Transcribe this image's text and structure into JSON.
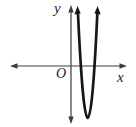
{
  "figure": {
    "width_px": 136,
    "height_px": 127
  },
  "labels": {
    "y_axis": "y",
    "x_axis": "x",
    "origin": "O"
  },
  "colors": {
    "background": "#ffffff",
    "axis": "#3d3d3d",
    "curve": "#161616"
  },
  "geometry": {
    "x_axis_d": "M 13 66 H 124",
    "y_axis_d": "M 71 8 V 121",
    "x_axis_left_arrow_d": "M 10 66 L 17.5 63.3 L 17.5 68.7 Z",
    "x_axis_right_arrow_d": "M 127 66 L 119.5 63.3 L 119.5 68.7 Z",
    "y_axis_top_arrow_d": "M 71 5 L 68.3 12.5 L 73.7 12.5 Z",
    "y_axis_bottom_arrow_d": "M 71 124 L 68.3 116.5 L 73.7 116.5 Z",
    "parabola_d": "M 78 14 Q 87.8 222 97.3 14",
    "parabola_left_arrow_d": "M 77.5 6 L 74.4 14.4 L 80.7 13.6 Z",
    "parabola_right_arrow_d": "M 97.6 6 L 94.4 13.6 L 100.7 14.4 Z"
  },
  "chart_data": {
    "type": "line",
    "title": "",
    "xlabel": "x",
    "ylabel": "y",
    "origin_label": "O",
    "axes": {
      "tick_labels": "none",
      "grid": false
    },
    "series": [
      {
        "name": "parabola",
        "shape": "upward-opening parabola",
        "vertex_px": [
          87.8,
          118
        ],
        "vertex_relative_to_origin_px": [
          16.8,
          -52
        ],
        "x_intercepts_px": [
          [
            80.9,
            66
          ],
          [
            94.5,
            66
          ]
        ],
        "x_intercepts_relative_to_origin_px": [
          9.9,
          23.5
        ],
        "branch_tip_px": [
          [
            78,
            14
          ],
          [
            97.3,
            14
          ]
        ],
        "opens": "up",
        "arrowheads_on_branches": true
      }
    ],
    "origin_px": [
      71,
      66
    ],
    "x_axis_span_px": [
      10,
      127
    ],
    "y_axis_span_px": [
      5,
      124
    ]
  }
}
